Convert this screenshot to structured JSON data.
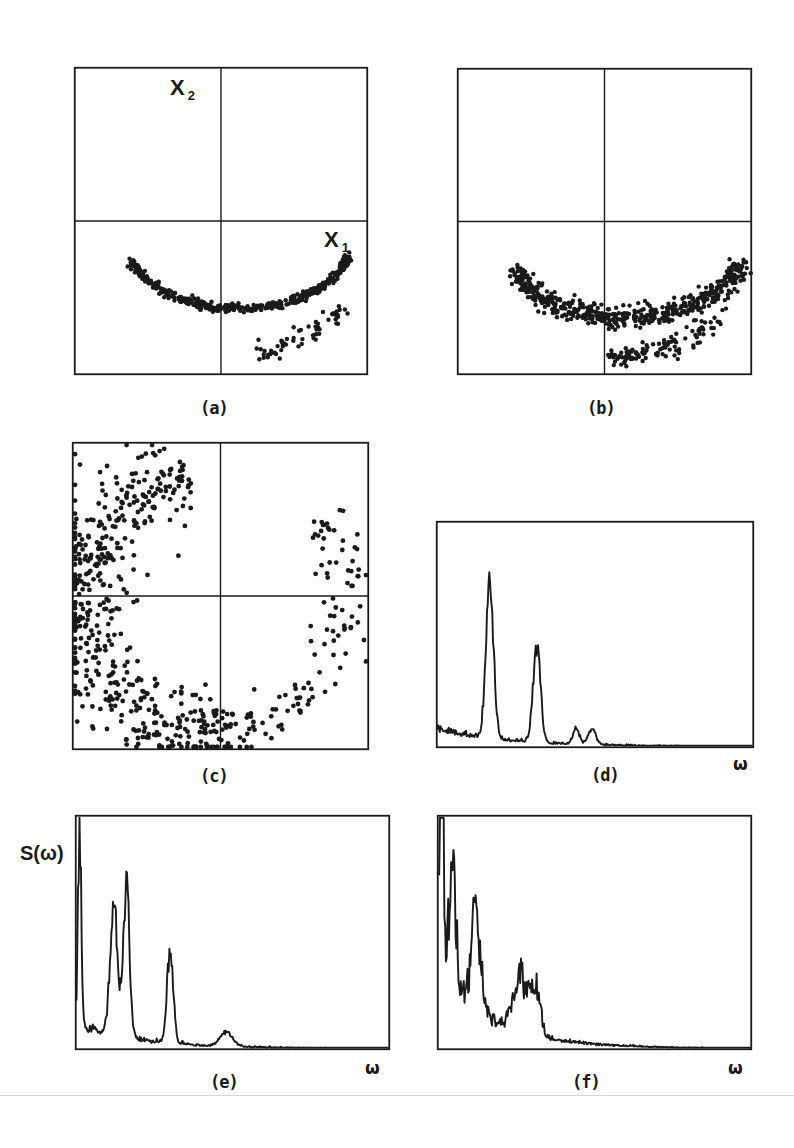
{
  "figure": {
    "panels": {
      "a": {
        "caption": "(a)",
        "x_label": "X",
        "x_sub": "1",
        "y_label": "X",
        "y_sub": "2"
      },
      "b": {
        "caption": "(b)"
      },
      "c": {
        "caption": "(c)"
      },
      "d": {
        "caption": "(d)",
        "x_label": "ω"
      },
      "e": {
        "caption": "(e)",
        "x_label": "ω",
        "y_label": "S(ω)"
      },
      "f": {
        "caption": "(f)",
        "x_label": "ω"
      }
    },
    "line_color": "#1a1a1a"
  },
  "chart_data": [
    {
      "id": "a",
      "type": "scatter",
      "title": "(a)",
      "xlabel": "X1",
      "ylabel": "X2",
      "grid": false,
      "crosshair_axes": true,
      "xlim": [
        -1,
        1
      ],
      "ylim": [
        -1,
        1
      ],
      "description": "Dense thin U-shaped arc in lower half, from (-0.33,-0.25) through (0.1,-0.55) to (0.9,-0.4); secondary sparse branch below right",
      "arc": {
        "cx": 0.12,
        "cy": -0.1,
        "rx": 0.78,
        "ry": 0.47,
        "theta_start": 200,
        "theta_end": 345,
        "spread": 0.015,
        "n": 420
      },
      "branch": {
        "points": [
          [
            0.25,
            -0.88
          ],
          [
            0.45,
            -0.8
          ],
          [
            0.65,
            -0.7
          ],
          [
            0.85,
            -0.55
          ]
        ],
        "spread": 0.03,
        "n": 60
      }
    },
    {
      "id": "b",
      "type": "scatter",
      "title": "(b)",
      "xlabel": "X1",
      "ylabel": "X2",
      "grid": false,
      "crosshair_axes": true,
      "xlim": [
        -1,
        1
      ],
      "ylim": [
        -1,
        1
      ],
      "description": "Thicker U-shaped band in lower half with a second parallel branch below the right side",
      "arc": {
        "cx": 0.15,
        "cy": -0.2,
        "rx": 0.78,
        "ry": 0.43,
        "theta_start": 195,
        "theta_end": 350,
        "spread": 0.035,
        "n": 520
      },
      "branch": {
        "points": [
          [
            0.0,
            -0.9
          ],
          [
            0.3,
            -0.85
          ],
          [
            0.55,
            -0.78
          ],
          [
            0.8,
            -0.62
          ]
        ],
        "spread": 0.035,
        "n": 110
      }
    },
    {
      "id": "c",
      "type": "scatter",
      "title": "(c)",
      "xlabel": "X1",
      "ylabel": "X2",
      "grid": false,
      "crosshair_axes": true,
      "xlim": [
        -1,
        1
      ],
      "ylim": [
        -1,
        1
      ],
      "description": "Diffuse C-shaped ring of points, dense on the left side, sparse on the right",
      "ring": {
        "cx": -0.05,
        "cy": -0.05,
        "rx": 0.9,
        "ry": 0.85,
        "dense_theta": [
          100,
          280
        ],
        "sparse_theta": [
          280,
          400
        ],
        "dense_n": 520,
        "sparse_n": 110,
        "spread": 0.12
      }
    },
    {
      "id": "d",
      "type": "line",
      "title": "(d)",
      "xlabel": "ω",
      "ylabel": "S(ω)",
      "xlim": [
        0,
        1
      ],
      "ylim": [
        0,
        1
      ],
      "peaks": [
        {
          "x": 0.166,
          "height": 0.7,
          "width": 0.012
        },
        {
          "x": 0.315,
          "height": 0.41,
          "width": 0.012
        },
        {
          "x": 0.44,
          "height": 0.07,
          "width": 0.01
        },
        {
          "x": 0.49,
          "height": 0.07,
          "width": 0.012
        }
      ],
      "noise_floor": 0.07,
      "decay": 5.0,
      "noise": 0.06
    },
    {
      "id": "e",
      "type": "line",
      "title": "(e)",
      "xlabel": "ω",
      "ylabel": "S(ω)",
      "xlim": [
        0,
        1
      ],
      "ylim": [
        0,
        1
      ],
      "peaks": [
        {
          "x": 0.01,
          "height": 0.85,
          "width": 0.005
        },
        {
          "x": 0.12,
          "height": 0.55,
          "width": 0.012
        },
        {
          "x": 0.16,
          "height": 0.65,
          "width": 0.01
        },
        {
          "x": 0.3,
          "height": 0.4,
          "width": 0.01
        },
        {
          "x": 0.48,
          "height": 0.06,
          "width": 0.02
        }
      ],
      "noise_floor": 0.1,
      "decay": 5.5,
      "noise": 0.07
    },
    {
      "id": "f",
      "type": "line",
      "title": "(f)",
      "xlabel": "ω",
      "ylabel": "S(ω)",
      "xlim": [
        0,
        1
      ],
      "ylim": [
        0,
        1
      ],
      "peaks": [
        {
          "x": 0.01,
          "height": 1.0,
          "width": 0.006
        },
        {
          "x": 0.045,
          "height": 0.6,
          "width": 0.01
        },
        {
          "x": 0.12,
          "height": 0.4,
          "width": 0.015
        },
        {
          "x": 0.26,
          "height": 0.25,
          "width": 0.02
        },
        {
          "x": 0.31,
          "height": 0.23,
          "width": 0.015
        }
      ],
      "noise_floor": 0.35,
      "decay": 6.0,
      "noise": 0.12
    }
  ]
}
